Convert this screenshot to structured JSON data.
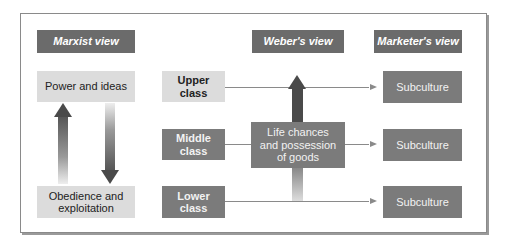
{
  "headers": {
    "marxist": "Marxist view",
    "weber": "Weber's view",
    "marketer": "Marketer's view"
  },
  "marxist": {
    "top": "Power and ideas",
    "bottom_line1": "Obedience and",
    "bottom_line2": "exploitation"
  },
  "classes": [
    {
      "line1": "Upper",
      "line2": "class"
    },
    {
      "line1": "Middle",
      "line2": "class"
    },
    {
      "line1": "Lower",
      "line2": "class"
    }
  ],
  "weber": {
    "line1": "Life chances",
    "line2": "and possession",
    "line3": "of goods"
  },
  "subcultures": [
    "Subculture",
    "Subculture",
    "Subculture"
  ],
  "colors": {
    "header_bg": "#6b6b6b",
    "light_box": "#dcdcdc",
    "dark_box": "#7b7b7b",
    "arrow": "#4a4a4a"
  }
}
